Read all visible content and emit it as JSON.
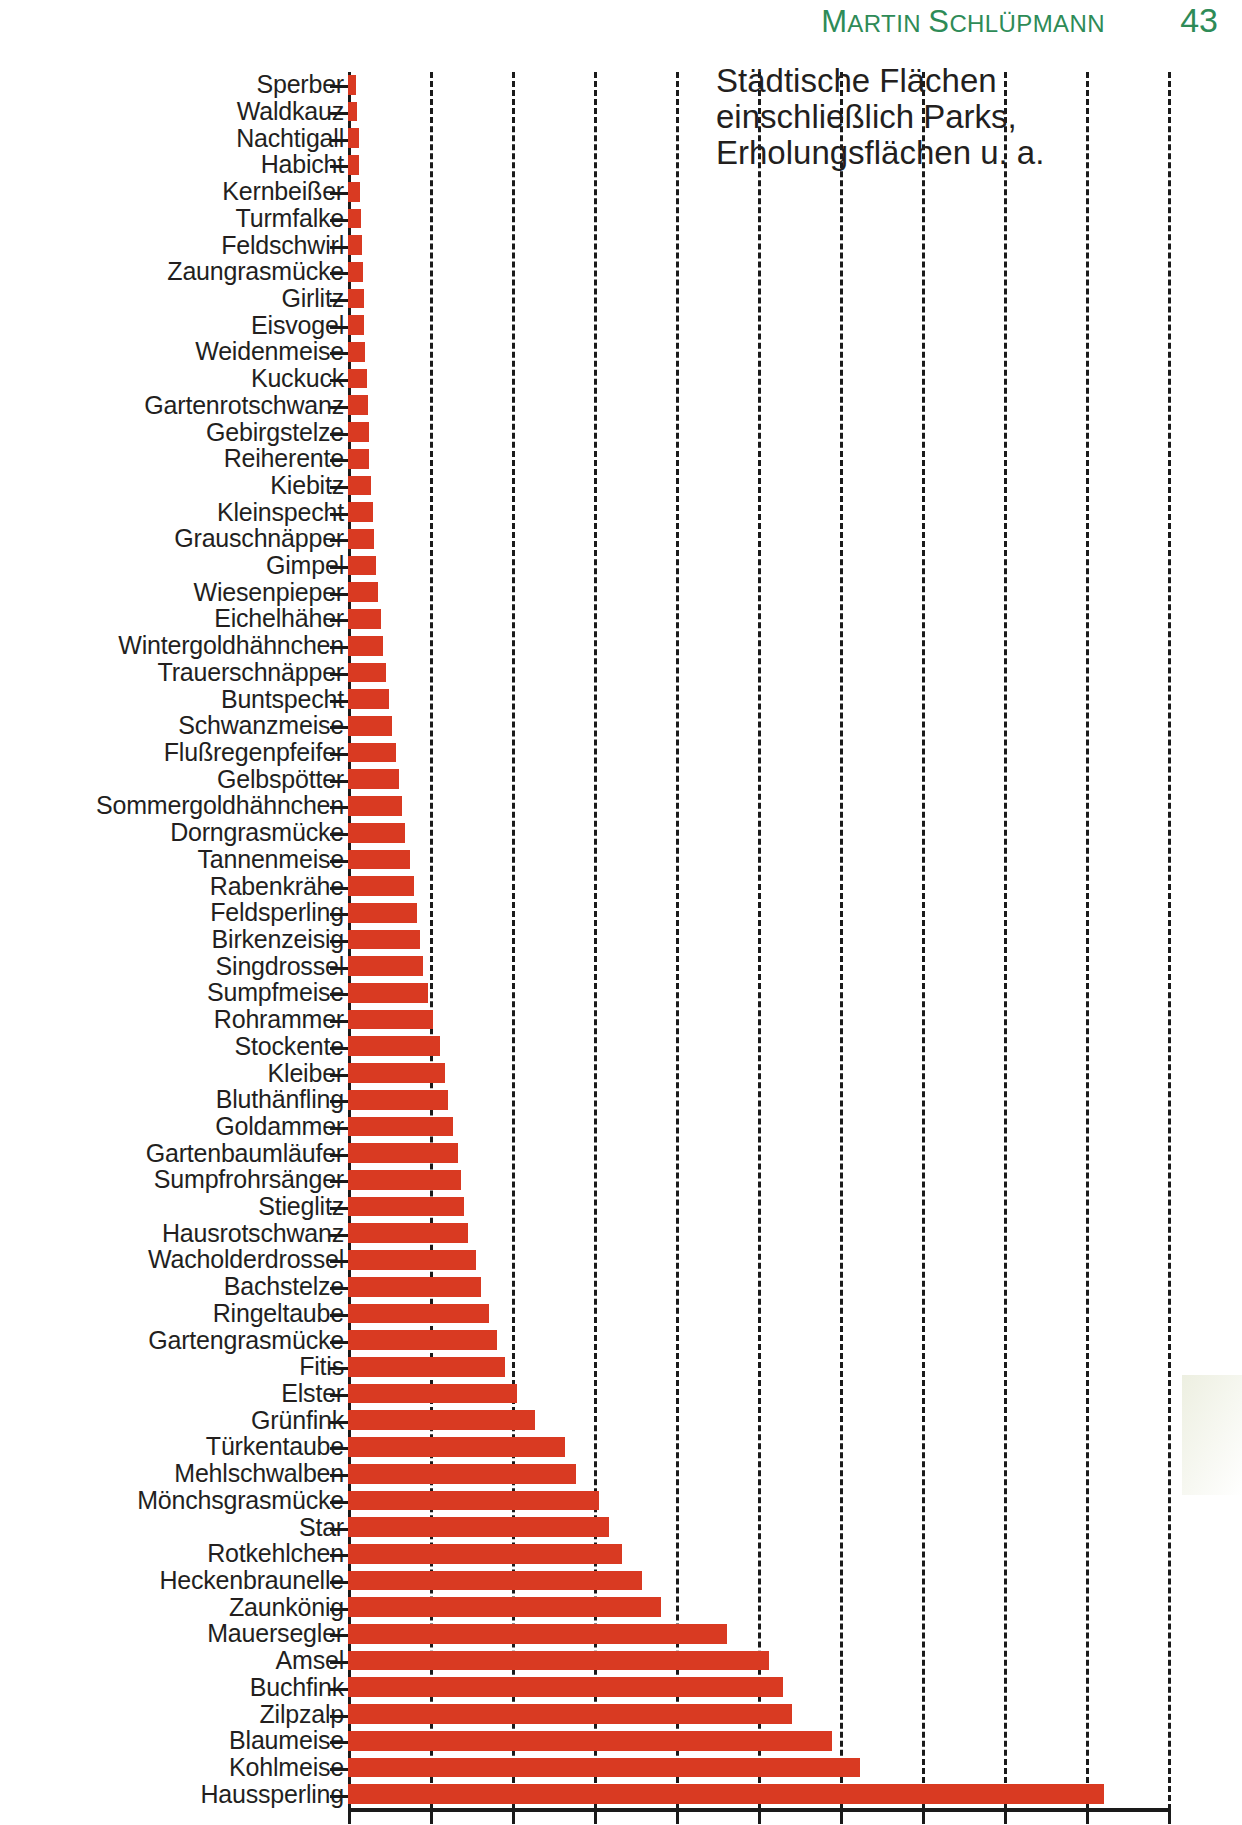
{
  "header": {
    "author_first": "Martin",
    "author_last": "Schlüpmann",
    "author_full": "MARTIN SCHLÜPMANN",
    "page_number": "43",
    "color": "#2e8b57"
  },
  "annotation": {
    "text": "Städtische Flächen\neinschließlich Parks,\nErholungsflächen u. a."
  },
  "chart_data": {
    "type": "bar",
    "orientation": "horizontal",
    "title": "Städtische Flächen einschließlich Parks, Erholungsflächen u. a.",
    "xlabel": "",
    "ylabel": "",
    "bar_color": "#d93a22",
    "grid": true,
    "grid_axis": "x",
    "xlim": [
      0,
      10
    ],
    "xticks": [
      0,
      1,
      2,
      3,
      4,
      5,
      6,
      7,
      8,
      9,
      10
    ],
    "legend": "none",
    "categories": [
      "Sperber",
      "Waldkauz",
      "Nachtigall",
      "Habicht",
      "Kernbeißer",
      "Turmfalke",
      "Feldschwirl",
      "Zaungrasmücke",
      "Girlitz",
      "Eisvogel",
      "Weidenmeise",
      "Kuckuck",
      "Gartenrotschwanz",
      "Gebirgstelze",
      "Reiherente",
      "Kiebitz",
      "Kleinspecht",
      "Grauschnäpper",
      "Gimpel",
      "Wiesenpieper",
      "Eichelhäher",
      "Wintergoldhähnchen",
      "Trauerschnäpper",
      "Buntspecht",
      "Schwanzmeise",
      "Flußregenpfeifer",
      "Gelbspötter",
      "Sommergoldhähnchen",
      "Dorngrasmücke",
      "Tannenmeise",
      "Rabenkrähe",
      "Feldsperling",
      "Birkenzeisig",
      "Singdrossel",
      "Sumpfmeise",
      "Rohrammer",
      "Stockente",
      "Kleiber",
      "Bluthänfling",
      "Goldammer",
      "Gartenbaumläufer",
      "Sumpfrohrsänger",
      "Stieglitz",
      "Hausrotschwanz",
      "Wacholderdrossel",
      "Bachstelze",
      "Ringeltaube",
      "Gartengrasmücke",
      "Fitis",
      "Elster",
      "Grünfink",
      "Türkentaube",
      "Mehlschwalben",
      "Mönchsgrasmücke",
      "Star",
      "Rotkehlchen",
      "Heckenbraunelle",
      "Zaunkönig",
      "Mauersegler",
      "Amsel",
      "Buchfink",
      "Zilpzalp",
      "Blaumeise",
      "Kohlmeise",
      "Haussperling"
    ],
    "values": [
      0.1,
      0.11,
      0.13,
      0.14,
      0.15,
      0.16,
      0.17,
      0.18,
      0.19,
      0.2,
      0.21,
      0.23,
      0.24,
      0.25,
      0.26,
      0.28,
      0.3,
      0.32,
      0.34,
      0.36,
      0.4,
      0.43,
      0.46,
      0.5,
      0.54,
      0.58,
      0.62,
      0.66,
      0.7,
      0.75,
      0.8,
      0.84,
      0.88,
      0.92,
      0.98,
      1.04,
      1.12,
      1.18,
      1.22,
      1.28,
      1.34,
      1.38,
      1.42,
      1.46,
      1.56,
      1.62,
      1.72,
      1.82,
      1.92,
      2.06,
      2.28,
      2.65,
      2.78,
      3.06,
      3.18,
      3.34,
      3.58,
      3.82,
      4.62,
      5.14,
      5.3,
      5.42,
      5.9,
      6.24,
      9.22
    ]
  }
}
